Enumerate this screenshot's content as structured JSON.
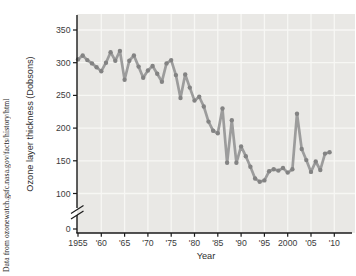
{
  "caption": "Data from ozonewatch.gsfc.nasa.gov/facts/history/html",
  "chart_data": {
    "type": "line",
    "title": "",
    "xlabel": "Year",
    "ylabel": "Ozone layer thickness (Dobsons)",
    "ylim": [
      0,
      370
    ],
    "axis_break_between": [
      0,
      100
    ],
    "grid": true,
    "y_tick_values": [
      350,
      300,
      250,
      200,
      150,
      100
    ],
    "y_zero_label": "0",
    "x_tick_years": [
      1955,
      1960,
      1965,
      1970,
      1975,
      1980,
      1985,
      1990,
      1995,
      2000,
      2005,
      2010
    ],
    "x_tick_labels": [
      "1955",
      "'60",
      "'65",
      "'70",
      "'75",
      "'80",
      "'85",
      "'90",
      "'95",
      "2000",
      "'05",
      "'10"
    ],
    "years": [
      1955,
      1956,
      1957,
      1958,
      1959,
      1960,
      1961,
      1962,
      1963,
      1964,
      1965,
      1966,
      1967,
      1968,
      1969,
      1970,
      1971,
      1972,
      1973,
      1974,
      1975,
      1976,
      1977,
      1978,
      1979,
      1980,
      1981,
      1982,
      1983,
      1984,
      1985,
      1986,
      1987,
      1988,
      1989,
      1990,
      1991,
      1992,
      1993,
      1994,
      1995,
      1996,
      1997,
      1998,
      1999,
      2000,
      2001,
      2002,
      2003,
      2004,
      2005,
      2006,
      2007,
      2008,
      2009
    ],
    "values": [
      305,
      311,
      304,
      299,
      293,
      287,
      300,
      316,
      303,
      318,
      274,
      303,
      311,
      294,
      277,
      288,
      295,
      283,
      271,
      299,
      304,
      281,
      246,
      282,
      262,
      242,
      248,
      233,
      210,
      196,
      192,
      230,
      147,
      212,
      147,
      172,
      157,
      141,
      123,
      118,
      120,
      134,
      137,
      135,
      139,
      132,
      137,
      222,
      168,
      151,
      133,
      149,
      136,
      161,
      163
    ],
    "colors": {
      "plot_bg": "#e9e8e5",
      "gridline": "#f7f7f4",
      "line": "#9c9c9c",
      "marker": "#838383",
      "axis": "#1a1a1a",
      "tick_label": "#3b3b3b",
      "axis_label": "#2e2e2e"
    }
  }
}
